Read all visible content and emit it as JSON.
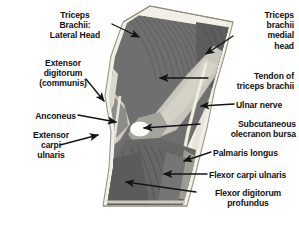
{
  "figure": {
    "orientation": "limb runs from upper-left to lower-right",
    "palette": {
      "background": "#ffffff",
      "skin_outline": "#f2efe6",
      "skin_edge": "#b9b3a4",
      "fascia_light": "#cfcabc",
      "muscle_dark": "#6e6e6e",
      "muscle_mid": "#8a8a8a",
      "muscle_deep": "#595959",
      "tendon_pale": "#c9c7bd",
      "bursa_white": "#fbfbf6",
      "bone_grey": "#a0a09a",
      "arrow": "#141414",
      "text": "#111111"
    }
  },
  "labels": [
    {
      "id": "triceps-brachii-lateral-head",
      "text": "Triceps\nBrachii:\nLateral Head",
      "side": "left",
      "align": "center",
      "x": 36,
      "y": 10,
      "width": 78,
      "arrow": {
        "x1": 112,
        "y1": 24,
        "x2": 139,
        "y2": 37
      }
    },
    {
      "id": "extensor-digitorum-communis",
      "text": "Extensor\ndigitorum\n(communis)",
      "side": "left",
      "align": "center",
      "x": 22,
      "y": 58,
      "width": 82,
      "arrow": {
        "x1": 86,
        "y1": 79,
        "x2": 104,
        "y2": 101
      }
    },
    {
      "id": "anconeus",
      "text": "Anconeus",
      "side": "left",
      "align": "right",
      "x": 14,
      "y": 111,
      "width": 62,
      "arrow": {
        "x1": 78,
        "y1": 115,
        "x2": 116,
        "y2": 122
      }
    },
    {
      "id": "extensor-carpi-ulnaris",
      "text": "Extensor\ncarpi\nulnaris",
      "side": "left",
      "align": "center",
      "x": 18,
      "y": 130,
      "width": 66,
      "arrow": {
        "x1": 60,
        "y1": 145,
        "x2": 98,
        "y2": 135
      }
    },
    {
      "id": "triceps-brachii-medial-head",
      "text": "Triceps\nbrachii\nmedial\nhead",
      "side": "right",
      "align": "right",
      "x": 236,
      "y": 10,
      "width": 58,
      "arrow": {
        "x1": 233,
        "y1": 36,
        "x2": 206,
        "y2": 54
      }
    },
    {
      "id": "tendon-of-triceps-brachii",
      "text": "Tendon of\ntriceps brachii",
      "side": "right",
      "align": "right",
      "x": 210,
      "y": 71,
      "width": 84,
      "arrow": {
        "x1": 208,
        "y1": 78,
        "x2": 160,
        "y2": 78
      }
    },
    {
      "id": "ulnar-nerve",
      "text": "Ulnar nerve",
      "side": "right",
      "align": "left",
      "x": 236,
      "y": 100,
      "width": 62,
      "arrow": {
        "x1": 234,
        "y1": 104,
        "x2": 201,
        "y2": 106
      }
    },
    {
      "id": "subcutaneous-olecranon-bursa",
      "text": "Subcutaneous\nolecranon bursa",
      "side": "right",
      "align": "right",
      "x": 202,
      "y": 119,
      "width": 94,
      "arrow": {
        "x1": 200,
        "y1": 124,
        "x2": 144,
        "y2": 128
      }
    },
    {
      "id": "palmaris-longus",
      "text": "Palmaris longus",
      "side": "right",
      "align": "left",
      "x": 213,
      "y": 148,
      "width": 84,
      "arrow": {
        "x1": 211,
        "y1": 152,
        "x2": 184,
        "y2": 161
      }
    },
    {
      "id": "flexor-carpi-ulnaris",
      "text": "Flexor carpi ulnaris",
      "side": "right",
      "align": "left",
      "x": 209,
      "y": 170,
      "width": 92,
      "arrow": {
        "x1": 207,
        "y1": 174,
        "x2": 164,
        "y2": 174
      }
    },
    {
      "id": "flexor-digitorum-profundus",
      "text": "Flexor digitorum\nprofundus",
      "side": "right",
      "align": "center",
      "x": 198,
      "y": 188,
      "width": 100,
      "arrow": {
        "x1": 196,
        "y1": 192,
        "x2": 126,
        "y2": 182
      }
    }
  ]
}
